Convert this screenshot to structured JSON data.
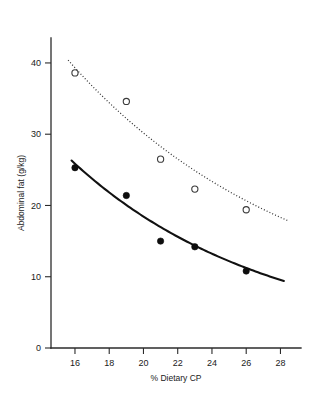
{
  "chart_data": {
    "type": "scatter",
    "title": "",
    "subtitle": "",
    "xlabel": "% Dietary CP",
    "ylabel": "Abdominal fat (g/kg)",
    "xlim": [
      14.6,
      29.2
    ],
    "ylim": [
      0,
      43.5
    ],
    "xticks": [
      16,
      18,
      20,
      22,
      24,
      26,
      28
    ],
    "yticks": [
      0,
      10,
      20,
      30,
      40
    ],
    "xtick_labels": [
      "16",
      "18",
      "20",
      "22",
      "24",
      "26",
      "28"
    ],
    "ytick_labels": [
      "0",
      "10",
      "20",
      "30",
      "40"
    ],
    "grid": false,
    "legend": "none",
    "series": [
      {
        "name": "open-circle-series",
        "marker": "open-circle",
        "line_style": "dotted",
        "x": [
          16,
          19,
          21,
          23,
          26
        ],
        "values": [
          38.6,
          34.6,
          26.5,
          22.3,
          19.4
        ],
        "fit_curve": {
          "x_start": 15.6,
          "x_end": 28.4,
          "y_start": 40.4,
          "y_end": 17.9
        }
      },
      {
        "name": "filled-circle-series",
        "marker": "filled-circle",
        "line_style": "solid",
        "x": [
          16,
          19,
          21,
          23,
          26
        ],
        "values": [
          25.3,
          21.4,
          15.0,
          14.2,
          10.8
        ],
        "fit_curve": {
          "x_start": 15.8,
          "x_end": 28.2,
          "y_start": 26.3,
          "y_end": 9.4
        }
      }
    ]
  },
  "figure": {
    "background_color": "#ffffff",
    "axis_color": "#2b2b2b",
    "solid_series_color": "#111111",
    "dotted_series_color": "#333333"
  }
}
